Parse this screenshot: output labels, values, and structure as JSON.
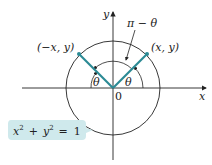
{
  "diagram": {
    "axis_x_label": "x",
    "axis_y_label": "y",
    "origin_label": "0",
    "point_right_label": "(x, y)",
    "point_left_label": "(−x, y)",
    "angle_right_label": "θ",
    "angle_left_label": "θ",
    "supplement_label": "π − θ",
    "equation": {
      "x_var": "x",
      "y_var": "y",
      "exp": "2",
      "plus": "+",
      "equals": "=",
      "rhs": "1"
    },
    "colors": {
      "ray": "#2b8a94",
      "callout_fill": "#cfe9ec",
      "stroke": "#222222"
    }
  }
}
